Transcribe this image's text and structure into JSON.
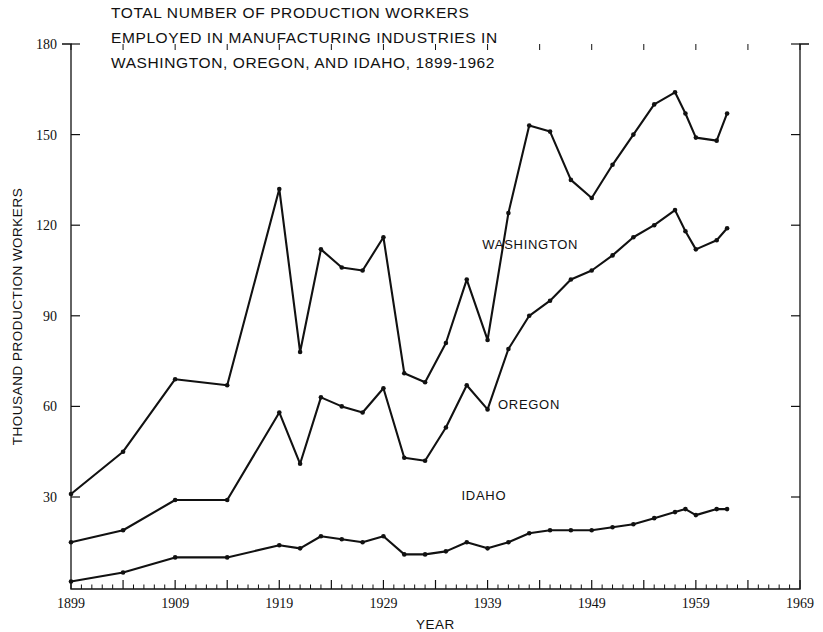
{
  "figure": {
    "title_lines": [
      "TOTAL NUMBER OF PRODUCTION WORKERS",
      "EMPLOYED IN MANUFACTURING INDUSTRIES IN",
      "WASHINGTON, OREGON, AND IDAHO, 1899-1962"
    ],
    "ink_color": "#111111",
    "background_color": "#ffffff"
  },
  "chart_data": {
    "type": "line",
    "xlabel": "YEAR",
    "ylabel": "THOUSAND PRODUCTION WORKERS",
    "xlim": [
      1899,
      1969
    ],
    "ylim": [
      0,
      180
    ],
    "grid": false,
    "legend": "inline-labels",
    "x_ticks_major": [
      1899,
      1909,
      1919,
      1929,
      1939,
      1949,
      1959,
      1969
    ],
    "x_tick_labels": [
      "1899",
      "1909",
      "1919",
      "1929",
      "1939",
      "1949",
      "1959",
      "1969"
    ],
    "x_tick_minor_step": 1,
    "x_tick_major_step": 5,
    "y_ticks": [
      30,
      60,
      90,
      120,
      150,
      180
    ],
    "y_tick_labels": [
      "30",
      "60",
      "90",
      "120",
      "150",
      "180"
    ],
    "series": [
      {
        "name": "WASHINGTON",
        "label_x": 1938.5,
        "label_y": 112,
        "points": [
          [
            1899,
            31
          ],
          [
            1904,
            45
          ],
          [
            1909,
            69
          ],
          [
            1914,
            67
          ],
          [
            1919,
            132
          ],
          [
            1921,
            78
          ],
          [
            1923,
            112
          ],
          [
            1925,
            106
          ],
          [
            1927,
            105
          ],
          [
            1929,
            116
          ],
          [
            1931,
            71
          ],
          [
            1933,
            68
          ],
          [
            1935,
            81
          ],
          [
            1937,
            102
          ],
          [
            1939,
            82
          ],
          [
            1941,
            124
          ],
          [
            1943,
            153
          ],
          [
            1945,
            151
          ],
          [
            1947,
            135
          ],
          [
            1949,
            129
          ],
          [
            1951,
            140
          ],
          [
            1953,
            150
          ],
          [
            1955,
            160
          ],
          [
            1957,
            164
          ],
          [
            1958,
            157
          ],
          [
            1959,
            149
          ],
          [
            1961,
            148
          ],
          [
            1962,
            157
          ]
        ]
      },
      {
        "name": "OREGON",
        "label_x": 1940,
        "label_y": 59,
        "points": [
          [
            1899,
            15
          ],
          [
            1904,
            19
          ],
          [
            1909,
            29
          ],
          [
            1914,
            29
          ],
          [
            1919,
            58
          ],
          [
            1921,
            41
          ],
          [
            1923,
            63
          ],
          [
            1925,
            60
          ],
          [
            1927,
            58
          ],
          [
            1929,
            66
          ],
          [
            1931,
            43
          ],
          [
            1933,
            42
          ],
          [
            1935,
            53
          ],
          [
            1937,
            67
          ],
          [
            1939,
            59
          ],
          [
            1941,
            79
          ],
          [
            1943,
            90
          ],
          [
            1945,
            95
          ],
          [
            1947,
            102
          ],
          [
            1949,
            105
          ],
          [
            1951,
            110
          ],
          [
            1953,
            116
          ],
          [
            1955,
            120
          ],
          [
            1957,
            125
          ],
          [
            1958,
            118
          ],
          [
            1959,
            112
          ],
          [
            1961,
            115
          ],
          [
            1962,
            119
          ]
        ]
      },
      {
        "name": "IDAHO",
        "label_x": 1936.5,
        "label_y": 29,
        "points": [
          [
            1899,
            2
          ],
          [
            1904,
            5
          ],
          [
            1909,
            10
          ],
          [
            1914,
            10
          ],
          [
            1919,
            14
          ],
          [
            1921,
            13
          ],
          [
            1923,
            17
          ],
          [
            1925,
            16
          ],
          [
            1927,
            15
          ],
          [
            1929,
            17
          ],
          [
            1931,
            11
          ],
          [
            1933,
            11
          ],
          [
            1935,
            12
          ],
          [
            1937,
            15
          ],
          [
            1939,
            13
          ],
          [
            1941,
            15
          ],
          [
            1943,
            18
          ],
          [
            1945,
            19
          ],
          [
            1947,
            19
          ],
          [
            1949,
            19
          ],
          [
            1951,
            20
          ],
          [
            1953,
            21
          ],
          [
            1955,
            23
          ],
          [
            1957,
            25
          ],
          [
            1958,
            26
          ],
          [
            1959,
            24
          ],
          [
            1961,
            26
          ],
          [
            1962,
            26
          ]
        ]
      }
    ]
  }
}
